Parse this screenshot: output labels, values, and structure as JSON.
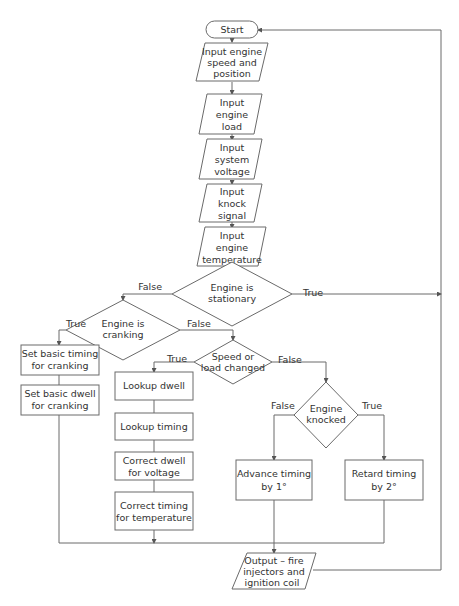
{
  "diagram": {
    "type": "flowchart",
    "nodes": {
      "start": {
        "shape": "terminator",
        "lines": [
          "Start"
        ]
      },
      "in_speed": {
        "shape": "input",
        "lines": [
          "Input engine",
          "speed and",
          "position"
        ]
      },
      "in_load": {
        "shape": "input",
        "lines": [
          "Input",
          "engine",
          "load"
        ]
      },
      "in_voltage": {
        "shape": "input",
        "lines": [
          "Input",
          "system",
          "voltage"
        ]
      },
      "in_knock": {
        "shape": "input",
        "lines": [
          "Input",
          "knock",
          "signal"
        ]
      },
      "in_temp": {
        "shape": "input",
        "lines": [
          "Input",
          "engine",
          "temperature"
        ]
      },
      "dec_stationary": {
        "shape": "decision",
        "lines": [
          "Engine is",
          "stationary"
        ]
      },
      "dec_cranking": {
        "shape": "decision",
        "lines": [
          "Engine is",
          "cranking"
        ]
      },
      "set_timing_crank": {
        "shape": "process",
        "lines": [
          "Set basic timing",
          "for cranking"
        ]
      },
      "set_dwell_crank": {
        "shape": "process",
        "lines": [
          "Set basic dwell",
          "for cranking"
        ]
      },
      "dec_speed_load": {
        "shape": "decision",
        "lines": [
          "Speed or",
          "load changed"
        ]
      },
      "lookup_dwell": {
        "shape": "process",
        "lines": [
          "Lookup dwell"
        ]
      },
      "lookup_timing": {
        "shape": "process",
        "lines": [
          "Lookup timing"
        ]
      },
      "correct_dwell": {
        "shape": "process",
        "lines": [
          "Correct dwell",
          "for voltage"
        ]
      },
      "correct_timing": {
        "shape": "process",
        "lines": [
          "Correct timing",
          "for temperature"
        ]
      },
      "dec_knocked": {
        "shape": "decision",
        "lines": [
          "Engine",
          "knocked"
        ]
      },
      "advance": {
        "shape": "process",
        "lines": [
          "Advance timing",
          "by 1°"
        ]
      },
      "retard": {
        "shape": "process",
        "lines": [
          "Retard timing",
          "by 2°"
        ]
      },
      "output": {
        "shape": "output",
        "lines": [
          "Output – fire",
          "injectors and",
          "ignition coil"
        ]
      }
    },
    "edge_labels": {
      "stationary_false": "False",
      "stationary_true": "True",
      "cranking_true": "True",
      "cranking_false": "False",
      "speed_true": "True",
      "speed_false": "False",
      "knocked_false": "False",
      "knocked_true": "True"
    },
    "colors": {
      "stroke": "#6a6a6a",
      "text": "#333333",
      "background": "#ffffff"
    }
  }
}
